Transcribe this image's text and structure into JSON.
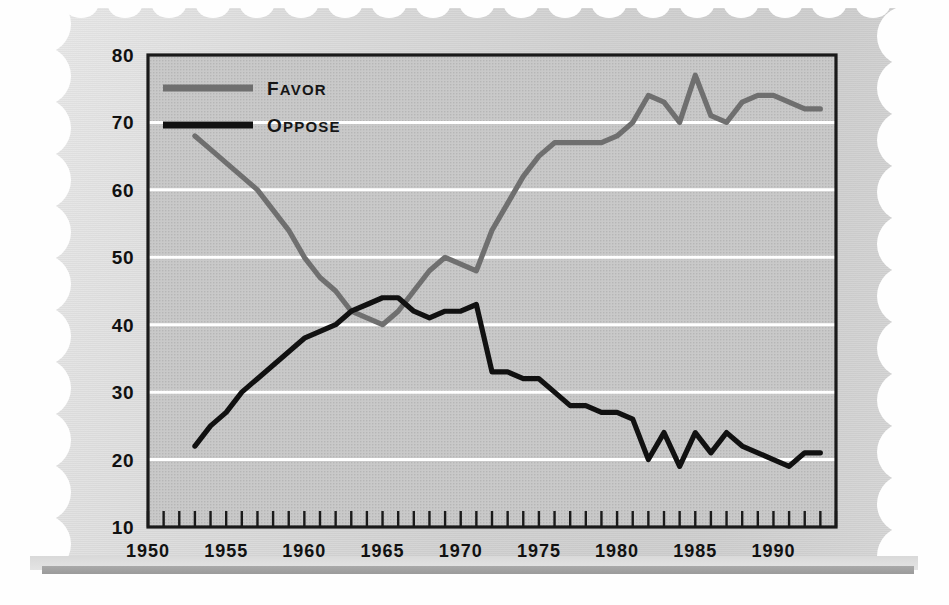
{
  "chart_data": {
    "type": "line",
    "title": "",
    "xlabel": "",
    "ylabel": "",
    "xlim": [
      1950,
      1994
    ],
    "ylim": [
      10,
      80
    ],
    "grid": true,
    "grid_color": "#ffffff",
    "background_color": "#cfcfcf",
    "legend_position": "top-left",
    "x_tick_labels": [
      "1950",
      "1955",
      "1960",
      "1965",
      "1970",
      "1975",
      "1980",
      "1985",
      "1990"
    ],
    "x_tick_values": [
      1950,
      1955,
      1960,
      1965,
      1970,
      1975,
      1980,
      1985,
      1990
    ],
    "x_minor_tick_step": 1,
    "y_tick_labels": [
      "10",
      "20",
      "30",
      "40",
      "50",
      "60",
      "70",
      "80"
    ],
    "y_tick_values": [
      10,
      20,
      30,
      40,
      50,
      60,
      70,
      80
    ],
    "series": [
      {
        "name": "Favor",
        "color": "#6f6f6f",
        "x": [
          1953,
          1954,
          1955,
          1956,
          1957,
          1958,
          1959,
          1960,
          1961,
          1962,
          1963,
          1964,
          1965,
          1966,
          1967,
          1968,
          1969,
          1970,
          1971,
          1972,
          1973,
          1974,
          1975,
          1976,
          1977,
          1978,
          1979,
          1980,
          1981,
          1982,
          1983,
          1984,
          1985,
          1986,
          1987,
          1988,
          1989,
          1990,
          1991,
          1992,
          1993
        ],
        "values": [
          68,
          66,
          64,
          62,
          60,
          57,
          54,
          50,
          47,
          45,
          42,
          41,
          40,
          42,
          45,
          48,
          50,
          49,
          48,
          54,
          58,
          62,
          65,
          67,
          67,
          67,
          67,
          68,
          70,
          74,
          73,
          70,
          77,
          71,
          70,
          73,
          74,
          74,
          73,
          72,
          72
        ]
      },
      {
        "name": "Oppose",
        "color": "#111111",
        "x": [
          1953,
          1954,
          1955,
          1956,
          1957,
          1958,
          1959,
          1960,
          1961,
          1962,
          1963,
          1964,
          1965,
          1966,
          1967,
          1968,
          1969,
          1970,
          1971,
          1972,
          1973,
          1974,
          1975,
          1976,
          1977,
          1978,
          1979,
          1980,
          1981,
          1982,
          1983,
          1984,
          1985,
          1986,
          1987,
          1988,
          1989,
          1990,
          1991,
          1992,
          1993
        ],
        "values": [
          22,
          25,
          27,
          30,
          32,
          34,
          36,
          38,
          39,
          40,
          42,
          43,
          44,
          44,
          42,
          41,
          42,
          42,
          43,
          33,
          33,
          32,
          32,
          30,
          28,
          28,
          27,
          27,
          26,
          20,
          24,
          19,
          24,
          21,
          24,
          22,
          21,
          20,
          19,
          21,
          21
        ]
      }
    ],
    "annotations": []
  },
  "legend": {
    "items": [
      {
        "label": "Favor",
        "color": "#6f6f6f"
      },
      {
        "label": "Oppose",
        "color": "#111111"
      }
    ]
  },
  "axes": {
    "y_labels": [
      "80",
      "70",
      "60",
      "50",
      "40",
      "30",
      "20",
      "10"
    ],
    "x_labels": [
      "1950",
      "1955",
      "1960",
      "1965",
      "1970",
      "1975",
      "1980",
      "1985",
      "1990"
    ]
  }
}
